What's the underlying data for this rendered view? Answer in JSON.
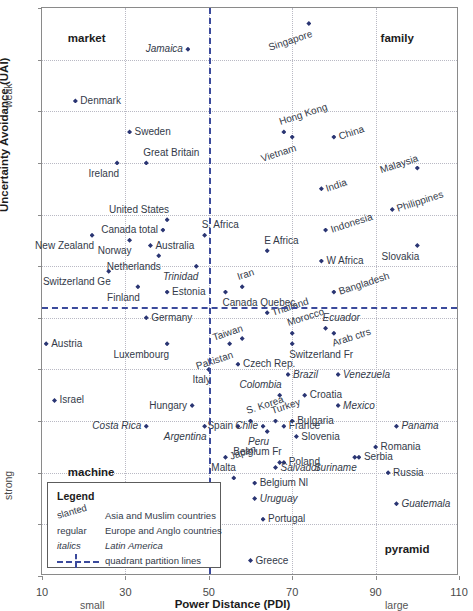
{
  "chart_data": {
    "type": "scatter",
    "title": "",
    "xlabel": "Power Distance (PDI)",
    "ylabel": "Uncertainty Avoidance (UAI)",
    "xlim": [
      10,
      110
    ],
    "ylim": [
      5,
      115
    ],
    "y_inverted": true,
    "xticks": [
      10,
      30,
      50,
      70,
      90,
      110
    ],
    "yticks": [
      5,
      15,
      25,
      35,
      45,
      55,
      65,
      75,
      85,
      95,
      105,
      115
    ],
    "grid": true,
    "x_axis_low_label": "small",
    "x_axis_high_label": "large",
    "y_axis_low_label": "weak",
    "y_axis_high_label": "strong",
    "accent_color": "#2a3573",
    "partition_color": "#3b4a9c",
    "partition_x": 50,
    "partition_y": 63,
    "quadrant_labels": [
      {
        "name": "market",
        "x": 21,
        "y": 11
      },
      {
        "name": "family",
        "x": 96,
        "y": 11
      },
      {
        "name": "machine",
        "x": 21,
        "y": 95
      },
      {
        "name": "pyramid",
        "x": 97,
        "y": 110
      }
    ],
    "groups": {
      "asia_muslim": "Asia and Muslim countries",
      "europe_anglo": "Europe and Anglo countries",
      "latin_america": "Latin America"
    },
    "points": [
      {
        "label": "Jamaica",
        "x": 45,
        "y": 13,
        "group": "latin_america",
        "pos": "left"
      },
      {
        "label": "Singapore",
        "x": 74,
        "y": 8,
        "group": "asia_muslim",
        "pos": "below-l"
      },
      {
        "label": "Denmark",
        "x": 18,
        "y": 23,
        "group": "europe_anglo",
        "pos": "right"
      },
      {
        "label": "Sweden",
        "x": 31,
        "y": 29,
        "group": "europe_anglo",
        "pos": "right"
      },
      {
        "label": "Hong Kong",
        "x": 68,
        "y": 29,
        "group": "asia_muslim",
        "pos": "above"
      },
      {
        "label": "China",
        "x": 80,
        "y": 30,
        "group": "asia_muslim",
        "pos": "right"
      },
      {
        "label": "Vietnam",
        "x": 70,
        "y": 30,
        "group": "asia_muslim",
        "pos": "below-l"
      },
      {
        "label": "Great Britain",
        "x": 35,
        "y": 35,
        "group": "europe_anglo",
        "pos": "above"
      },
      {
        "label": "Ireland",
        "x": 28,
        "y": 35,
        "group": "europe_anglo",
        "pos": "below-l"
      },
      {
        "label": "Malaysia",
        "x": 100,
        "y": 36,
        "group": "asia_muslim",
        "pos": "above-l"
      },
      {
        "label": "India",
        "x": 77,
        "y": 40,
        "group": "asia_muslim",
        "pos": "right"
      },
      {
        "label": "United States",
        "x": 40,
        "y": 46,
        "group": "europe_anglo",
        "pos": "above-l"
      },
      {
        "label": "Philippines",
        "x": 94,
        "y": 44,
        "group": "asia_muslim",
        "pos": "right"
      },
      {
        "label": "Canada total",
        "x": 39,
        "y": 48,
        "group": "europe_anglo",
        "pos": "left"
      },
      {
        "label": "S. Africa",
        "x": 49,
        "y": 49,
        "group": "europe_anglo",
        "pos": "above"
      },
      {
        "label": "New Zealand",
        "x": 22,
        "y": 49,
        "group": "europe_anglo",
        "pos": "below-l"
      },
      {
        "label": "Norway",
        "x": 31,
        "y": 50,
        "group": "europe_anglo",
        "pos": "below-l"
      },
      {
        "label": "Australia",
        "x": 36,
        "y": 51,
        "group": "europe_anglo",
        "pos": "right"
      },
      {
        "label": "Indonesia",
        "x": 78,
        "y": 48,
        "group": "asia_muslim",
        "pos": "right"
      },
      {
        "label": "Slovakia",
        "x": 100,
        "y": 51,
        "group": "europe_anglo",
        "pos": "below-l"
      },
      {
        "label": "E Africa",
        "x": 64,
        "y": 52,
        "group": "europe_anglo",
        "pos": "above"
      },
      {
        "label": "W Africa",
        "x": 77,
        "y": 54,
        "group": "europe_anglo",
        "pos": "right"
      },
      {
        "label": "Netherlands",
        "x": 38,
        "y": 53,
        "group": "europe_anglo",
        "pos": "below-l"
      },
      {
        "label": "Switzerland Ge",
        "x": 26,
        "y": 56,
        "group": "europe_anglo",
        "pos": "below-l"
      },
      {
        "label": "Trinidad",
        "x": 47,
        "y": 55,
        "group": "latin_america",
        "pos": "below-l"
      },
      {
        "label": "Iran",
        "x": 58,
        "y": 59,
        "group": "asia_muslim",
        "pos": "above"
      },
      {
        "label": "Canada Quebec",
        "x": 54,
        "y": 60,
        "group": "europe_anglo",
        "pos": "below"
      },
      {
        "label": "Finland",
        "x": 33,
        "y": 59,
        "group": "europe_anglo",
        "pos": "below-l"
      },
      {
        "label": "Estonia",
        "x": 40,
        "y": 60,
        "group": "europe_anglo",
        "pos": "right"
      },
      {
        "label": "Bangladesh",
        "x": 80,
        "y": 60,
        "group": "asia_muslim",
        "pos": "right"
      },
      {
        "label": "Germany",
        "x": 35,
        "y": 65,
        "group": "europe_anglo",
        "pos": "right"
      },
      {
        "label": "Thailand",
        "x": 64,
        "y": 64,
        "group": "asia_muslim",
        "pos": "right"
      },
      {
        "label": "Ecuador",
        "x": 78,
        "y": 67,
        "group": "latin_america",
        "pos": "above"
      },
      {
        "label": "Taiwan",
        "x": 58,
        "y": 69,
        "group": "asia_muslim",
        "pos": "above-l"
      },
      {
        "label": "Morocco",
        "x": 70,
        "y": 68,
        "group": "asia_muslim",
        "pos": "above"
      },
      {
        "label": "Austria",
        "x": 11,
        "y": 70,
        "group": "europe_anglo",
        "pos": "right"
      },
      {
        "label": "Luxembourg",
        "x": 40,
        "y": 70,
        "group": "europe_anglo",
        "pos": "below-l"
      },
      {
        "label": "Pakistan",
        "x": 55,
        "y": 70,
        "group": "asia_muslim",
        "pos": "below-l"
      },
      {
        "label": "Arab ctrs",
        "x": 80,
        "y": 68,
        "group": "asia_muslim",
        "pos": "below"
      },
      {
        "label": "Switzerland Fr",
        "x": 70,
        "y": 70,
        "group": "europe_anglo",
        "pos": "below"
      },
      {
        "label": "Czech Rep.",
        "x": 57,
        "y": 74,
        "group": "europe_anglo",
        "pos": "right"
      },
      {
        "label": "Italy",
        "x": 50,
        "y": 75,
        "group": "europe_anglo",
        "pos": "below-l"
      },
      {
        "label": "Brazil",
        "x": 69,
        "y": 76,
        "group": "latin_america",
        "pos": "right"
      },
      {
        "label": "Venezuela",
        "x": 81,
        "y": 76,
        "group": "latin_america",
        "pos": "right"
      },
      {
        "label": "Israel",
        "x": 13,
        "y": 81,
        "group": "europe_anglo",
        "pos": "right"
      },
      {
        "label": "Colombia",
        "x": 67,
        "y": 80,
        "group": "latin_america",
        "pos": "above-l"
      },
      {
        "label": "Croatia",
        "x": 73,
        "y": 80,
        "group": "europe_anglo",
        "pos": "right"
      },
      {
        "label": "Hungary",
        "x": 46,
        "y": 82,
        "group": "europe_anglo",
        "pos": "left"
      },
      {
        "label": "Mexico",
        "x": 81,
        "y": 82,
        "group": "latin_america",
        "pos": "right"
      },
      {
        "label": "Costa Rica",
        "x": 35,
        "y": 86,
        "group": "latin_america",
        "pos": "left"
      },
      {
        "label": "Argentina",
        "x": 49,
        "y": 86,
        "group": "latin_america",
        "pos": "below-l"
      },
      {
        "label": "Spain",
        "x": 57,
        "y": 86,
        "group": "europe_anglo",
        "pos": "left"
      },
      {
        "label": "S. Korea",
        "x": 60,
        "y": 85,
        "group": "asia_muslim",
        "pos": "above"
      },
      {
        "label": "Chile",
        "x": 63,
        "y": 86,
        "group": "latin_america",
        "pos": "left"
      },
      {
        "label": "Turkey",
        "x": 66,
        "y": 85,
        "group": "asia_muslim",
        "pos": "above"
      },
      {
        "label": "Bulgaria",
        "x": 70,
        "y": 85,
        "group": "europe_anglo",
        "pos": "right"
      },
      {
        "label": "Panama",
        "x": 95,
        "y": 86,
        "group": "latin_america",
        "pos": "right"
      },
      {
        "label": "Peru",
        "x": 64,
        "y": 87,
        "group": "latin_america",
        "pos": "below-l"
      },
      {
        "label": "France",
        "x": 68,
        "y": 86,
        "group": "europe_anglo",
        "pos": "right"
      },
      {
        "label": "Slovenia",
        "x": 71,
        "y": 88,
        "group": "europe_anglo",
        "pos": "right"
      },
      {
        "label": "Romania",
        "x": 90,
        "y": 90,
        "group": "europe_anglo",
        "pos": "right"
      },
      {
        "label": "Japan",
        "x": 54,
        "y": 92,
        "group": "asia_muslim",
        "pos": "right"
      },
      {
        "label": "Belgium Fr",
        "x": 67,
        "y": 93,
        "group": "europe_anglo",
        "pos": "above-l"
      },
      {
        "label": "Serbia",
        "x": 86,
        "y": 92,
        "group": "europe_anglo",
        "pos": "right"
      },
      {
        "label": "Suriname",
        "x": 85,
        "y": 92,
        "group": "latin_america",
        "pos": "below-l"
      },
      {
        "label": "Poland",
        "x": 68,
        "y": 93,
        "group": "europe_anglo",
        "pos": "right"
      },
      {
        "label": "Malta",
        "x": 56,
        "y": 96,
        "group": "europe_anglo",
        "pos": "above-l"
      },
      {
        "label": "Salvador",
        "x": 66,
        "y": 94,
        "group": "latin_america",
        "pos": "right"
      },
      {
        "label": "Russia",
        "x": 93,
        "y": 95,
        "group": "europe_anglo",
        "pos": "right"
      },
      {
        "label": "Belgium Nl",
        "x": 61,
        "y": 97,
        "group": "europe_anglo",
        "pos": "right"
      },
      {
        "label": "Uruguay",
        "x": 61,
        "y": 100,
        "group": "latin_america",
        "pos": "right"
      },
      {
        "label": "Guatemala",
        "x": 95,
        "y": 101,
        "group": "latin_america",
        "pos": "right"
      },
      {
        "label": "Portugal",
        "x": 63,
        "y": 104,
        "group": "europe_anglo",
        "pos": "right"
      },
      {
        "label": "Greece",
        "x": 60,
        "y": 112,
        "group": "europe_anglo",
        "pos": "right"
      }
    ]
  },
  "legend": {
    "title": "Legend",
    "rows": [
      {
        "key": "slanted",
        "desc": "Asia and Muslim countries",
        "style": "slanted"
      },
      {
        "key": "regular",
        "desc": "Europe and Anglo countries",
        "style": "regular"
      },
      {
        "key": "italics",
        "desc": "Latin America",
        "style": "italics"
      },
      {
        "key": "",
        "desc": "quadrant partition lines",
        "style": "line"
      }
    ]
  }
}
